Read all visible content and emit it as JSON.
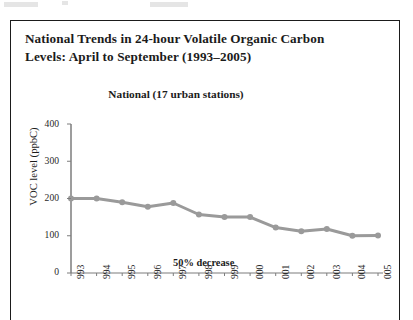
{
  "figure": {
    "title_line1": "National Trends in 24-hour Volatile Organic Carbon",
    "title_line2": "Levels: April to September (1993–2005)"
  },
  "chart_data": {
    "type": "line",
    "title": "National (17 urban stations)",
    "xlabel": "",
    "ylabel": "VOC level (ppbC)",
    "categories": [
      "1993",
      "1994",
      "1995",
      "1996",
      "1997",
      "1998",
      "1999",
      "2000",
      "2001",
      "2002",
      "2003",
      "2004",
      "2005"
    ],
    "tick_labels_visible": [
      "993",
      "994",
      "995",
      "996",
      "997",
      "998",
      "999",
      "000",
      "001",
      "002",
      "003",
      "004",
      "005"
    ],
    "values": [
      200,
      200,
      190,
      178,
      188,
      157,
      150,
      150,
      122,
      112,
      118,
      100,
      101
    ],
    "ylim": [
      0,
      400
    ],
    "yticks": [
      "0",
      "100",
      "200",
      "300",
      "400"
    ],
    "grid": false,
    "legend": "none",
    "annotations": [
      {
        "text": "50% decrease",
        "x": "2000",
        "y": 30
      }
    ],
    "series_color": "#9a9a9a",
    "marker": "circle"
  }
}
